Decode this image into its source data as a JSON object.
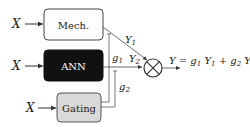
{
  "diagram": {
    "inputs": [
      {
        "label": "X",
        "target": "Mech."
      },
      {
        "label": "X",
        "target": "ANN"
      },
      {
        "label": "X",
        "target": "Gating"
      }
    ],
    "blocks": [
      {
        "id": "mech",
        "label": "Mech.",
        "fill": "#ffffff",
        "text_color": "#222222"
      },
      {
        "id": "ann",
        "label": "ANN",
        "fill": "#111111",
        "text_color": "#ffffff"
      },
      {
        "id": "gating",
        "label": "Gating",
        "fill": "#d9d9d9",
        "text_color": "#222222"
      }
    ],
    "signals": {
      "y1": "Y",
      "y1_sub": "1",
      "y2": "Y",
      "y2_sub": "2",
      "g1": "g",
      "g1_sub": "1",
      "g2": "g",
      "g2_sub": "2"
    },
    "combiner": {
      "symbol": "multiply-circle"
    },
    "output_equation": {
      "lhs": "Y",
      "eq": " = ",
      "t1g": "g",
      "t1g_sub": "1",
      "t1y": "Y",
      "t1y_sub": "1",
      "plus": " + ",
      "t2g": "g",
      "t2g_sub": "2",
      "t2y": "Y",
      "t2y_sub": "2"
    }
  }
}
